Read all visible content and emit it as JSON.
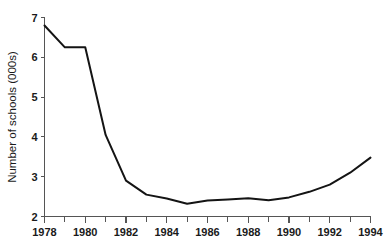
{
  "chart_data": {
    "type": "line",
    "title": "",
    "xlabel": "",
    "ylabel": "Number of schools (000s)",
    "xlim": [
      1978,
      1994
    ],
    "ylim": [
      2,
      7
    ],
    "grid": false,
    "legend": "none",
    "y_ticks": [
      2,
      3,
      4,
      5,
      6,
      7
    ],
    "y_tick_labels": [
      "2",
      "3",
      "4",
      "5",
      "6",
      "7"
    ],
    "x_ticks": [
      1978,
      1979,
      1980,
      1981,
      1982,
      1983,
      1984,
      1985,
      1986,
      1987,
      1988,
      1989,
      1990,
      1991,
      1992,
      1993,
      1994
    ],
    "x_tick_labels": [
      "1978",
      "",
      "1980",
      "",
      "1982",
      "",
      "1984",
      "",
      "1986",
      "",
      "1988",
      "",
      "1990",
      "",
      "1992",
      "",
      "1994"
    ],
    "x_labeled_ticks": [
      1978,
      1980,
      1982,
      1984,
      1986,
      1988,
      1990,
      1992,
      1994
    ],
    "series": [
      {
        "name": "Number of schools (000s)",
        "color": "#141414",
        "x": [
          1978,
          1979,
          1980,
          1981,
          1982,
          1983,
          1984,
          1985,
          1986,
          1987,
          1988,
          1989,
          1990,
          1991,
          1992,
          1993,
          1994
        ],
        "values": [
          6.8,
          6.25,
          6.25,
          4.05,
          2.9,
          2.55,
          2.45,
          2.32,
          2.4,
          2.43,
          2.46,
          2.41,
          2.48,
          2.62,
          2.8,
          3.1,
          3.48
        ]
      }
    ]
  },
  "axes": {
    "y_axis_label": "Number of schools (000s)"
  }
}
